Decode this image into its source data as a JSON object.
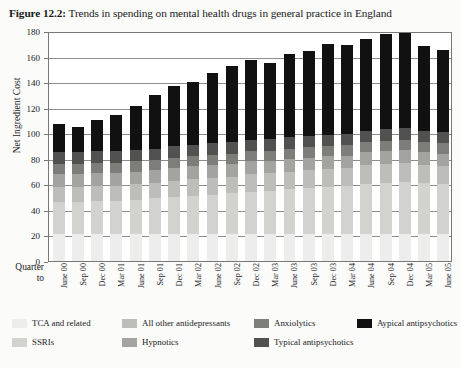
{
  "title": {
    "figure_number": "Figure 12.2:",
    "text": " Trends in spending on mental health drugs in general practice in England"
  },
  "axes": {
    "y_title": "Net Ingredient Cost",
    "y_ticks": [
      "0",
      "20",
      "40",
      "60",
      "80",
      "100",
      "120",
      "140",
      "160",
      "180"
    ],
    "x_corner_label_line1": "Quarter",
    "x_corner_label_line2": "to"
  },
  "legend": {
    "items": [
      {
        "label": "TCA and related",
        "color": "#ededeb"
      },
      {
        "label": "SSRIs",
        "color": "#d2d2cf"
      },
      {
        "label": "All other antidepressants",
        "color": "#bdbdba"
      },
      {
        "label": "Hypnotics",
        "color": "#a3a3a0"
      },
      {
        "label": "Anxiolytics",
        "color": "#7d7d7a"
      },
      {
        "label": "Typical antipsychotics",
        "color": "#515150"
      },
      {
        "label": "Aypical antipsychotics",
        "color": "#111111"
      }
    ]
  },
  "chart_data": {
    "type": "bar",
    "subtype": "stacked",
    "title": "Figure 12.2: Trends in spending on mental health drugs in general practice in England",
    "xlabel": "Quarter to",
    "ylabel": "Net Ingredient Cost",
    "ylim": [
      0,
      180
    ],
    "ytick_step": 20,
    "grid": true,
    "legend_position": "below",
    "categories": [
      "June 00",
      "Sep 00",
      "Dec 00",
      "Mar 01",
      "June 01",
      "Sep 01",
      "Dec 01",
      "Mar 02",
      "June 02",
      "Sep 02",
      "Dec 02",
      "Mar 03",
      "June 03",
      "Sep 03",
      "Dec 03",
      "Mar 04",
      "June 04",
      "Sep 04",
      "Dec 04",
      "Mar 05",
      "June 05"
    ],
    "series": [
      {
        "name": "TCA and related",
        "color": "#ededeb",
        "values": [
          21,
          21,
          21,
          21,
          21,
          21,
          21,
          21,
          21,
          21,
          21,
          21,
          21,
          21,
          21,
          21,
          21,
          21,
          21,
          21,
          21
        ]
      },
      {
        "name": "SSRIs",
        "color": "#d2d2cf",
        "values": [
          25,
          25,
          26,
          26,
          27,
          28,
          29,
          30,
          31,
          32,
          33,
          34,
          35,
          36,
          37,
          38,
          39,
          40,
          41,
          40,
          39
        ]
      },
      {
        "name": "All other antidepressants",
        "color": "#bdbdba",
        "values": [
          12,
          12,
          12,
          12,
          12,
          12,
          13,
          13,
          13,
          13,
          14,
          14,
          14,
          14,
          14,
          14,
          15,
          15,
          15,
          14,
          14
        ]
      },
      {
        "name": "Hypnotics",
        "color": "#a3a3a0",
        "values": [
          10,
          10,
          10,
          10,
          10,
          10,
          10,
          10,
          10,
          10,
          10,
          10,
          10,
          10,
          10,
          10,
          10,
          10,
          10,
          10,
          10
        ]
      },
      {
        "name": "Anxiolytics",
        "color": "#7d7d7a",
        "values": [
          8,
          8,
          8,
          8,
          8,
          8,
          8,
          8,
          8,
          8,
          8,
          8,
          8,
          8,
          8,
          8,
          8,
          8,
          8,
          8,
          8
        ]
      },
      {
        "name": "Typical antipsychotics",
        "color": "#515150",
        "values": [
          9,
          9,
          9,
          9,
          9,
          9,
          9,
          9,
          9,
          9,
          9,
          9,
          9,
          9,
          9,
          9,
          9,
          9,
          9,
          9,
          9
        ]
      },
      {
        "name": "Aypical antipsychotics",
        "color": "#111111",
        "values": [
          22,
          20,
          24,
          28,
          34,
          42,
          47,
          49,
          55,
          60,
          62,
          60,
          65,
          66,
          71,
          70,
          72,
          75,
          77,
          66,
          64
        ]
      }
    ],
    "totals": [
      107,
      105,
      110,
      114,
      121,
      130,
      137,
      140,
      147,
      153,
      157,
      155,
      162,
      164,
      170,
      169,
      174,
      178,
      181,
      168,
      165
    ]
  }
}
